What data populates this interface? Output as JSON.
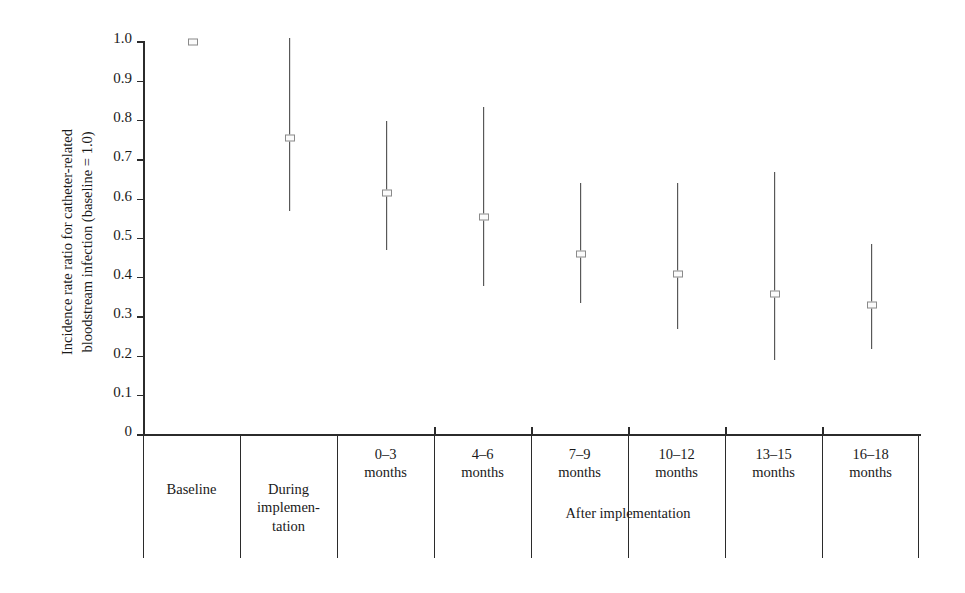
{
  "chart_data": {
    "type": "scatter",
    "title": "",
    "xlabel": "",
    "ylabel": "Incidence rate ratio for catheter-related\nbloodstream infection (baseline = 1.0)",
    "ylim": [
      0,
      1.0
    ],
    "ytick_labels": [
      "1.0",
      "0.9",
      "0.8",
      "0.7",
      "0.6",
      "0.5",
      "0.4",
      "0.3",
      "0.2",
      "0.1",
      "0"
    ],
    "ytick_values": [
      1.0,
      0.9,
      0.8,
      0.7,
      0.6,
      0.5,
      0.4,
      0.3,
      0.2,
      0.1,
      0
    ],
    "grid": false,
    "legend": "none",
    "categories": [
      "Baseline",
      "During\nimplemen-\ntation",
      "0–3\nmonths",
      "4–6\nmonths",
      "7–9\nmonths",
      "10–12\nmonths",
      "13–15\nmonths",
      "16–18\nmonths"
    ],
    "group_label": "After implementation",
    "group_span": [
      "0–3 months",
      "16–18 months"
    ],
    "series": [
      {
        "name": "Incidence rate ratio",
        "points": [
          {
            "category": "Baseline",
            "value": 1.0,
            "ci_low": null,
            "ci_high": null
          },
          {
            "category": "During implementation",
            "value": 0.755,
            "ci_low": 0.57,
            "ci_high": 1.01
          },
          {
            "category": "0–3 months",
            "value": 0.615,
            "ci_low": 0.47,
            "ci_high": 0.8
          },
          {
            "category": "4–6 months",
            "value": 0.555,
            "ci_low": 0.38,
            "ci_high": 0.835
          },
          {
            "category": "7–9 months",
            "value": 0.46,
            "ci_low": 0.335,
            "ci_high": 0.64
          },
          {
            "category": "10–12 months",
            "value": 0.41,
            "ci_low": 0.27,
            "ci_high": 0.64
          },
          {
            "category": "13–15 months",
            "value": 0.36,
            "ci_low": 0.19,
            "ci_high": 0.67
          },
          {
            "category": "16–18 months",
            "value": 0.33,
            "ci_low": 0.22,
            "ci_high": 0.485
          }
        ]
      }
    ]
  },
  "axis": {
    "y_title": "Incidence rate ratio for catheter-related\nbloodstream infection (baseline = 1.0)"
  },
  "colors": {
    "axis": "#2b2b2b",
    "errorbar": "#3a3a3a",
    "marker_edge": "#8a8a8a",
    "marker_fill": "#fbfbfb",
    "background": "#ffffff"
  }
}
